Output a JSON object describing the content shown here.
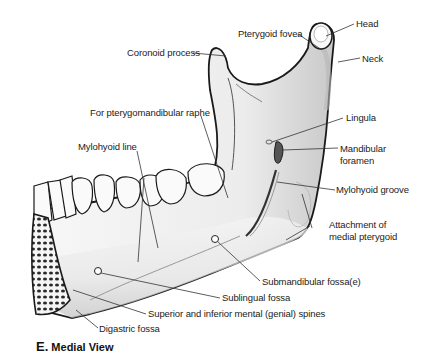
{
  "figure": {
    "caption_letter": "E.",
    "caption_text": "Medial View"
  },
  "labels": {
    "head": "Head",
    "pterygoid_fovea": "Pterygoid fovea",
    "coronoid_process": "Coronoid process",
    "neck": "Neck",
    "pterygomandibular_raphe": "For pterygomandibular raphe",
    "lingula": "Lingula",
    "mylohyoid_line": "Mylohyoid line",
    "mandibular_foramen_1": "Mandibular",
    "mandibular_foramen_2": "foramen",
    "mylohyoid_groove": "Mylohyoid groove",
    "medial_pterygoid_1": "Attachment of",
    "medial_pterygoid_2": "medial pterygoid",
    "submandibular_fossa": "Submandibular fossa(e)",
    "sublingual_fossa": "Sublingual fossa",
    "mental_spines": "Superior and inferior mental (genial) spines",
    "digastric_fossa": "Digastric fossa"
  },
  "colors": {
    "bone_fill": "#f2f2f2",
    "bone_shade": "#cfcfcf",
    "outline": "#1a1a1a",
    "leader": "#333333"
  }
}
